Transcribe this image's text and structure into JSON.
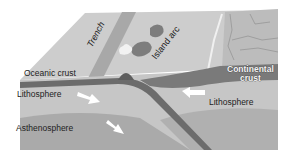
{
  "diagram": {
    "labels": {
      "trench": "Trench",
      "island_arc": "Island arc",
      "oceanic_crust": "Oceanic crust",
      "continental_crust_line1": "Continental",
      "continental_crust_line2": "crust",
      "lithosphere_left": "Lithosphere",
      "lithosphere_right": "Lithosphere",
      "asthenosphere": "Asthenosphere"
    },
    "arrows": [
      {
        "name": "lithosphere-left-arrow",
        "direction": "down-right"
      },
      {
        "name": "asthenosphere-arrow",
        "direction": "down-right"
      },
      {
        "name": "lithosphere-right-arrow",
        "direction": "left"
      }
    ],
    "colors": {
      "surface_top": "#c9c9c9",
      "surface_land": "#bdbdbd",
      "crust_band": "#6e6e6e",
      "lithosphere": "#c4c4c4",
      "asthenosphere": "#a9a9a9",
      "continental_crust": "#7a7a7a",
      "slab_edge": "#555555",
      "arrow": "#ffffff"
    }
  }
}
